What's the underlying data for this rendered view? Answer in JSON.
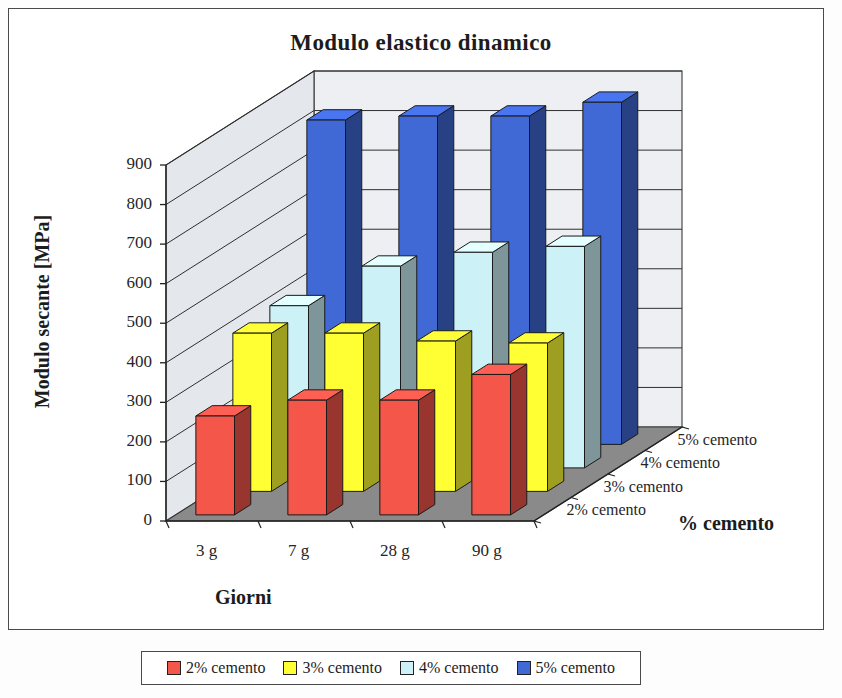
{
  "chart_data": {
    "type": "bar",
    "subtype": "3d-grouped-column",
    "title": "Modulo elastico dinamico",
    "xlabel": "Giorni",
    "ylabel": "Modulo secante [MPa]",
    "zlabel": "% cemento",
    "categories": [
      "3 g",
      "7 g",
      "28 g",
      "90 g"
    ],
    "series": [
      {
        "name": "2% cemento",
        "color": "#F4564A",
        "values": [
          250,
          290,
          290,
          355
        ]
      },
      {
        "name": "3% cemento",
        "color": "#FFFF33",
        "values": [
          400,
          400,
          380,
          375
        ]
      },
      {
        "name": "4% cemento",
        "color": "#CCF2F7",
        "values": [
          410,
          510,
          545,
          560
        ]
      },
      {
        "name": "5% cemento",
        "color": "#4169D6",
        "values": [
          820,
          830,
          830,
          865
        ]
      }
    ],
    "yticks": [
      0,
      100,
      200,
      300,
      400,
      500,
      600,
      700,
      800,
      900
    ],
    "ylim": [
      0,
      900
    ],
    "grid": true,
    "legend_position": "bottom"
  },
  "legend": {
    "items": [
      {
        "label": "2% cemento",
        "color": "#F4564A"
      },
      {
        "label": "3% cemento",
        "color": "#FFFF33"
      },
      {
        "label": "4% cemento",
        "color": "#CCF2F7"
      },
      {
        "label": "5% cemento",
        "color": "#4169D6"
      }
    ]
  },
  "colors": {
    "wall_back": "#EDEFF2",
    "wall_side": "#E4E7EB",
    "floor": "#8A8A8A",
    "frame": "#4a4a4a",
    "text": "#1c1c1c"
  }
}
